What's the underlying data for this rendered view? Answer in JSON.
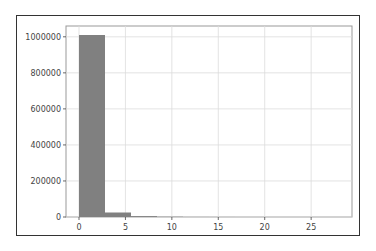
{
  "chart_data": {
    "type": "bar",
    "subtype": "histogram",
    "title": "",
    "xlabel": "",
    "ylabel": "",
    "bin_edges": [
      0,
      2.8,
      5.6,
      8.4,
      11.2,
      14.0,
      16.8,
      19.6,
      22.4,
      25.2,
      28.0
    ],
    "values": [
      1010000,
      25000,
      5000,
      1500,
      300,
      100,
      50,
      20,
      10,
      5
    ],
    "xlim": [
      -1.4,
      29.4
    ],
    "ylim": [
      0,
      1060000
    ],
    "x_ticks": [
      0,
      5,
      10,
      15,
      20,
      25
    ],
    "x_tick_labels": [
      "0",
      "5",
      "10",
      "15",
      "20",
      "25"
    ],
    "y_ticks": [
      0,
      200000,
      400000,
      600000,
      800000,
      1000000
    ],
    "y_tick_labels": [
      "0",
      "200000",
      "400000",
      "600000",
      "800000",
      "1000000"
    ],
    "grid": true,
    "legend": null,
    "bar_color": "#808080"
  }
}
